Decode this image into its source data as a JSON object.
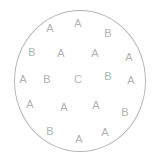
{
  "figure": {
    "type": "scatter-letter-map",
    "width": 157,
    "height": 162,
    "background_color": "#ffffff"
  },
  "circle": {
    "name": "boundary-circle",
    "center_x": 80,
    "center_y": 81,
    "radius_x": 66,
    "radius_y": 71,
    "stroke_color": "#b6b6b6",
    "stroke_width": 1,
    "fill": "none"
  },
  "style": {
    "label_color": "#b3b3b3",
    "label_font_size": 11
  },
  "chart_data": {
    "type": "scatter",
    "title": "",
    "xlabel": "",
    "ylabel": "",
    "legend": [],
    "categories": [
      "A",
      "B",
      "C"
    ],
    "category_counts": {
      "A": 14,
      "B": 5,
      "C": 1
    },
    "total_points": 20,
    "points": [
      {
        "label": "A",
        "x": 50,
        "y": 28
      },
      {
        "label": "A",
        "x": 78,
        "y": 23
      },
      {
        "label": "B",
        "x": 108,
        "y": 33
      },
      {
        "label": "B",
        "x": 32,
        "y": 52
      },
      {
        "label": "A",
        "x": 61,
        "y": 53
      },
      {
        "label": "A",
        "x": 95,
        "y": 53
      },
      {
        "label": "A",
        "x": 129,
        "y": 57
      },
      {
        "label": "A",
        "x": 23,
        "y": 79
      },
      {
        "label": "B",
        "x": 47,
        "y": 79
      },
      {
        "label": "C",
        "x": 78,
        "y": 79
      },
      {
        "label": "B",
        "x": 108,
        "y": 76
      },
      {
        "label": "A",
        "x": 131,
        "y": 80
      },
      {
        "label": "A",
        "x": 30,
        "y": 104
      },
      {
        "label": "A",
        "x": 64,
        "y": 107
      },
      {
        "label": "A",
        "x": 96,
        "y": 105
      },
      {
        "label": "B",
        "x": 125,
        "y": 112
      },
      {
        "label": "B",
        "x": 50,
        "y": 131
      },
      {
        "label": "A",
        "x": 79,
        "y": 139
      },
      {
        "label": "A",
        "x": 105,
        "y": 132
      }
    ]
  }
}
